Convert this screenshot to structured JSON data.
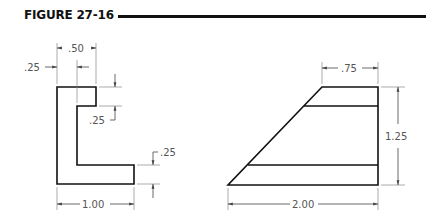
{
  "figure": {
    "title": "FIGURE 27-16"
  },
  "left_view": {
    "name": "L-shaped profile",
    "dimensions": {
      "top_width": ".50",
      "wall_thickness": ".25",
      "flange_drop": ".25",
      "bottom_flange_thickness": ".25",
      "overall_width": "1.00"
    }
  },
  "right_view": {
    "name": "tapered profile",
    "dimensions": {
      "top_width": ".75",
      "height": "1.25",
      "overall_width": "2.00"
    }
  },
  "colors": {
    "object_line": "#111111",
    "dimension_line": "#555555",
    "background": "#ffffff"
  }
}
